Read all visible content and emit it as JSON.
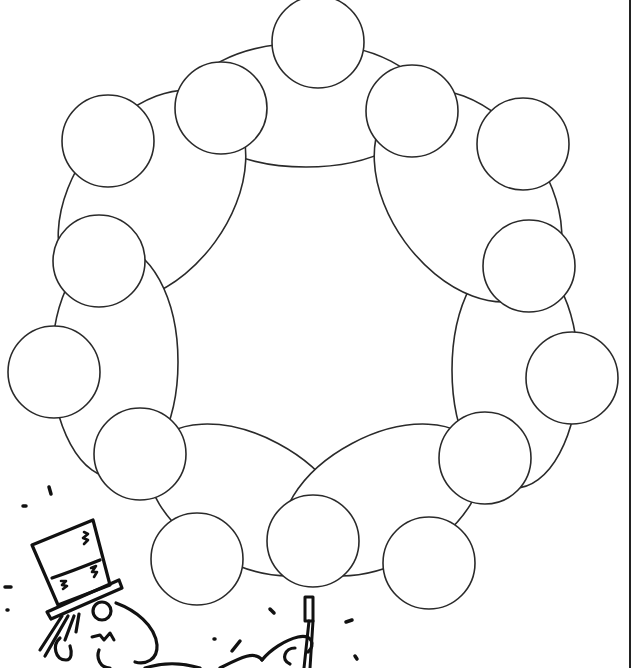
{
  "page": {
    "type": "worksheet-graphic-organizer",
    "width": 634,
    "height": 668,
    "background": "#ffffff",
    "stroke_color": "#2a2a2a",
    "ink_color": "#111111"
  },
  "organizer": {
    "description": "ring of 7 ellipses with 14 blank circles",
    "ellipses": [
      {
        "name": "ellipse-top",
        "cx": 306,
        "cy": 105,
        "rx": 120,
        "ry": 62,
        "rot": 0
      },
      {
        "name": "ellipse-upper-left",
        "cx": 152,
        "cy": 196,
        "rx": 78,
        "ry": 118,
        "rot": 36
      },
      {
        "name": "ellipse-left",
        "cx": 115,
        "cy": 362,
        "rx": 63,
        "ry": 116,
        "rot": 0
      },
      {
        "name": "ellipse-bottom-left",
        "cx": 248,
        "cy": 500,
        "rx": 108,
        "ry": 64,
        "rot": 28
      },
      {
        "name": "ellipse-bottom-right",
        "cx": 382,
        "cy": 500,
        "rx": 108,
        "ry": 64,
        "rot": -28
      },
      {
        "name": "ellipse-right",
        "cx": 515,
        "cy": 370,
        "rx": 63,
        "ry": 118,
        "rot": 0
      },
      {
        "name": "ellipse-upper-right",
        "cx": 468,
        "cy": 196,
        "rx": 78,
        "ry": 118,
        "rot": -36
      }
    ],
    "circles": [
      {
        "name": "circle-1",
        "cx": 318,
        "cy": 42,
        "r": 46,
        "text": ""
      },
      {
        "name": "circle-2",
        "cx": 221,
        "cy": 108,
        "r": 46,
        "text": ""
      },
      {
        "name": "circle-3",
        "cx": 412,
        "cy": 111,
        "r": 46,
        "text": ""
      },
      {
        "name": "circle-4",
        "cx": 108,
        "cy": 141,
        "r": 46,
        "text": ""
      },
      {
        "name": "circle-5",
        "cx": 523,
        "cy": 144,
        "r": 46,
        "text": ""
      },
      {
        "name": "circle-6",
        "cx": 99,
        "cy": 261,
        "r": 46,
        "text": ""
      },
      {
        "name": "circle-7",
        "cx": 529,
        "cy": 266,
        "r": 46,
        "text": ""
      },
      {
        "name": "circle-8",
        "cx": 54,
        "cy": 372,
        "r": 46,
        "text": ""
      },
      {
        "name": "circle-9",
        "cx": 572,
        "cy": 378,
        "r": 46,
        "text": ""
      },
      {
        "name": "circle-10",
        "cx": 140,
        "cy": 454,
        "r": 46,
        "text": ""
      },
      {
        "name": "circle-11",
        "cx": 485,
        "cy": 458,
        "r": 46,
        "text": ""
      },
      {
        "name": "circle-12",
        "cx": 197,
        "cy": 559,
        "r": 46,
        "text": ""
      },
      {
        "name": "circle-13",
        "cx": 313,
        "cy": 541,
        "r": 46,
        "text": ""
      },
      {
        "name": "circle-14",
        "cx": 429,
        "cy": 563,
        "r": 46,
        "text": ""
      }
    ]
  },
  "illustration": {
    "subject": "magician-with-top-hat-and-wand",
    "position": "bottom-left"
  }
}
